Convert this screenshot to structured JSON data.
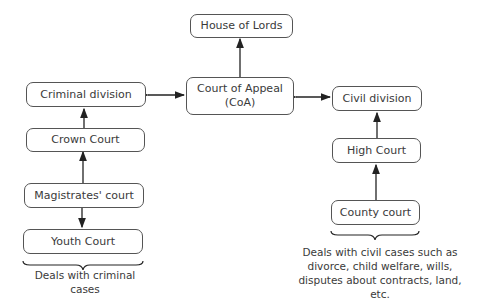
{
  "nodes": {
    "house_of_lords": "House of Lords",
    "court_of_appeal": "Court of Appeal",
    "court_of_appeal_abbr": "(CoA)",
    "criminal_division": "Criminal division",
    "crown_court": "Crown Court",
    "magistrates_court": "Magistrates' court",
    "youth_court": "Youth Court",
    "civil_division": "Civil division",
    "high_court": "High Court",
    "county_court": "County court"
  },
  "notes": {
    "criminal": "Deals  with criminal cases",
    "civil_line1": "Deals  with civil cases such as",
    "civil_line2": "divorce, child welfare, wills,",
    "civil_line3": "disputes about contracts, land, etc."
  },
  "colors": {
    "stroke": "#555555",
    "text": "#3a3a3a",
    "background": "#ffffff"
  }
}
